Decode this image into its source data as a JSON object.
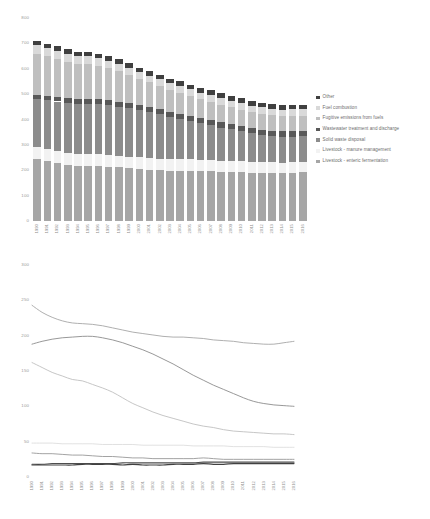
{
  "chart_data": [
    {
      "type": "bar",
      "title": "",
      "subtype": "stacked-column",
      "xlabel": "",
      "ylabel": "",
      "ylim": [
        0,
        800
      ],
      "yticks": [
        0,
        100,
        200,
        300,
        400,
        500,
        600,
        700,
        800
      ],
      "grid": false,
      "legend_position": "right",
      "categories": [
        "1990",
        "1991",
        "1992",
        "1993",
        "1994",
        "1995",
        "1996",
        "1997",
        "1998",
        "1999",
        "2000",
        "2001",
        "2002",
        "2003",
        "2004",
        "2005",
        "2006",
        "2007",
        "2008",
        "2009",
        "2010",
        "2011",
        "2012",
        "2013",
        "2014",
        "2015",
        "2016"
      ],
      "legend_order_top_to_bottom": [
        "Other",
        "Fuel combustion",
        "Fugitive emissions from fuels",
        "Wastewater treatment and discharge",
        "Solid waste disposal",
        "Livestock - manure management",
        "Livestock - enteric fermentation"
      ],
      "series": [
        {
          "name": "Livestock - enteric fermentation",
          "color": "#a6a6a6",
          "values": [
            243,
            236,
            228,
            221,
            218,
            217,
            216,
            214,
            211,
            208,
            205,
            203,
            201,
            199,
            198,
            198,
            197,
            196,
            194,
            193,
            192,
            190,
            189,
            188,
            188,
            190,
            192
          ]
        },
        {
          "name": "Livestock - manure management",
          "color": "#f2f2f2",
          "values": [
            48,
            48,
            48,
            47,
            47,
            47,
            47,
            46,
            46,
            46,
            46,
            45,
            45,
            45,
            45,
            45,
            44,
            44,
            44,
            44,
            43,
            43,
            43,
            43,
            42,
            42,
            42
          ]
        },
        {
          "name": "Solid waste disposal",
          "color": "#8c8c8c",
          "values": [
            188,
            192,
            195,
            197,
            198,
            199,
            199,
            197,
            194,
            190,
            185,
            180,
            174,
            167,
            160,
            152,
            144,
            137,
            130,
            124,
            118,
            112,
            107,
            104,
            102,
            101,
            100
          ]
        },
        {
          "name": "Wastewater treatment and discharge",
          "color": "#595959",
          "values": [
            18,
            18,
            19,
            19,
            19,
            19,
            19,
            19,
            19,
            20,
            20,
            20,
            20,
            20,
            20,
            20,
            20,
            21,
            21,
            21,
            21,
            21,
            21,
            21,
            21,
            21,
            21
          ]
        },
        {
          "name": "Fugitive emissions from fuels",
          "color": "#bfbfbf",
          "values": [
            162,
            155,
            148,
            143,
            138,
            136,
            131,
            126,
            120,
            112,
            104,
            98,
            92,
            87,
            83,
            79,
            75,
            72,
            70,
            67,
            65,
            64,
            63,
            62,
            61,
            61,
            60
          ]
        },
        {
          "name": "Fuel combustion",
          "color": "#d9d9d9",
          "values": [
            34,
            33,
            33,
            32,
            31,
            31,
            30,
            29,
            29,
            28,
            27,
            27,
            26,
            26,
            26,
            26,
            26,
            27,
            26,
            25,
            25,
            25,
            25,
            25,
            25,
            25,
            25
          ]
        },
        {
          "name": "Other",
          "color": "#404040",
          "values": [
            17,
            17,
            17,
            17,
            17,
            18,
            18,
            18,
            18,
            17,
            18,
            17,
            17,
            17,
            18,
            18,
            18,
            19,
            18,
            18,
            19,
            19,
            19,
            19,
            19,
            19,
            19
          ]
        }
      ],
      "totals": [
        710,
        699,
        688,
        676,
        668,
        667,
        660,
        649,
        637,
        621,
        605,
        590,
        575,
        561,
        550,
        538,
        524,
        516,
        503,
        492,
        483,
        474,
        467,
        462,
        458,
        459,
        459
      ]
    },
    {
      "type": "line",
      "title": "",
      "xlabel": "",
      "ylabel": "",
      "ylim": [
        0,
        300
      ],
      "yticks": [
        0,
        50,
        100,
        150,
        200,
        250,
        300
      ],
      "grid": false,
      "legend_position": "right",
      "x": [
        "1990",
        "1991",
        "1992",
        "1993",
        "1994",
        "1995",
        "1996",
        "1997",
        "1998",
        "1999",
        "2000",
        "2001",
        "2002",
        "2003",
        "2004",
        "2005",
        "2006",
        "2007",
        "2008",
        "2009",
        "2010",
        "2011",
        "2012",
        "2013",
        "2014",
        "2015",
        "2016"
      ],
      "series": [
        {
          "name": "Livestock - enteric fermentation",
          "color": "#a6a6a6",
          "width": 0.9,
          "values": [
            243,
            233,
            226,
            221,
            218,
            217,
            216,
            214,
            211,
            208,
            205,
            203,
            201,
            199,
            198,
            198,
            197,
            196,
            194,
            193,
            192,
            190,
            189,
            188,
            188,
            190,
            192
          ]
        },
        {
          "name": "Livestock - manure management",
          "color": "#d9d9d9",
          "width": 0.8,
          "values": [
            48,
            48,
            48,
            47,
            47,
            47,
            47,
            46,
            46,
            46,
            46,
            45,
            45,
            45,
            45,
            45,
            44,
            44,
            44,
            44,
            43,
            43,
            43,
            43,
            42,
            42,
            42
          ]
        },
        {
          "name": "Solid waste disposal",
          "color": "#8c8c8c",
          "width": 0.9,
          "values": [
            188,
            192,
            195,
            197,
            198,
            199,
            199,
            197,
            194,
            190,
            185,
            180,
            174,
            167,
            160,
            152,
            144,
            137,
            130,
            124,
            118,
            112,
            107,
            104,
            102,
            101,
            100
          ]
        },
        {
          "name": "Wastewater treatment and discharge",
          "color": "#4d4d4d",
          "width": 1.1,
          "values": [
            18,
            18,
            19,
            19,
            19,
            19,
            19,
            19,
            19,
            20,
            20,
            20,
            20,
            20,
            20,
            20,
            20,
            21,
            21,
            21,
            21,
            21,
            21,
            21,
            21,
            21,
            21
          ]
        },
        {
          "name": "Fugitive emissions from fuels",
          "color": "#bfbfbf",
          "width": 0.9,
          "values": [
            162,
            155,
            148,
            143,
            138,
            136,
            131,
            126,
            120,
            112,
            104,
            98,
            92,
            87,
            83,
            79,
            75,
            72,
            70,
            67,
            65,
            64,
            63,
            62,
            61,
            61,
            60
          ]
        },
        {
          "name": "Fuel combustion",
          "color": "#999999",
          "width": 0.9,
          "values": [
            34,
            33,
            33,
            32,
            31,
            31,
            30,
            29,
            29,
            28,
            27,
            27,
            26,
            26,
            26,
            26,
            26,
            27,
            26,
            25,
            25,
            25,
            25,
            25,
            25,
            25,
            25
          ]
        },
        {
          "name": "Other",
          "color": "#404040",
          "width": 1.2,
          "values": [
            17,
            17,
            17,
            17,
            17,
            18,
            18,
            18,
            18,
            17,
            18,
            17,
            17,
            17,
            18,
            18,
            18,
            19,
            18,
            18,
            19,
            19,
            19,
            19,
            19,
            19,
            19
          ]
        }
      ]
    }
  ]
}
